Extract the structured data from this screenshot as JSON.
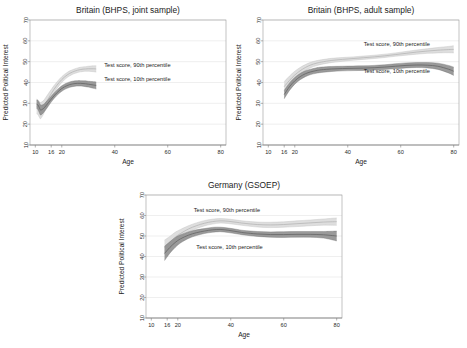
{
  "figure": {
    "name": "predicted-political-interest-by-age",
    "background": "#ffffff",
    "panel_count": 3
  },
  "style": {
    "band_90_fill": "#d9d9d9",
    "band_90_line": "#bcbcbc",
    "band_10_fill": "#8c8c8c",
    "band_10_line": "#6e6e6e",
    "gridline_color": "#dcdcdc",
    "frame_color": "#9a9a9a",
    "text_color": "#1c1c1c"
  },
  "chart_data": [
    {
      "type": "line",
      "panel_index": 0,
      "title": "Britain (BHPS, joint sample)",
      "xlabel": "Age",
      "ylabel": "Predicted Political Interest",
      "xlim": [
        8,
        82
      ],
      "ylim": [
        10,
        70
      ],
      "xticks": [
        10,
        16,
        20,
        40,
        60,
        80
      ],
      "xticklabels": [
        "10",
        "16",
        "20",
        "40",
        "60",
        "80"
      ],
      "yticks": [
        10,
        20,
        30,
        40,
        50,
        60,
        70
      ],
      "yticklabels": [
        "10",
        "20",
        "30",
        "40",
        "50",
        "60",
        "70"
      ],
      "grid": "horizontal",
      "legend": "inline-annotations",
      "annotations": [
        {
          "text": "Test score, 90th percentile",
          "x": 36,
          "y": 47.5
        },
        {
          "text": "Test score, 10th percentile",
          "x": 36,
          "y": 40.5
        }
      ],
      "series": [
        {
          "name": "Test score, 90th percentile",
          "color": "#d9d9d9",
          "x": [
            10.5,
            11,
            11.5,
            12,
            13,
            14,
            15,
            16,
            17,
            18,
            19,
            20,
            21,
            22,
            23,
            24,
            25,
            26,
            27,
            28,
            29,
            30,
            31,
            32,
            33
          ],
          "values": [
            28.6,
            28.2,
            27.2,
            26.6,
            28.0,
            30.2,
            32.4,
            34.6,
            36.6,
            38.4,
            40.0,
            41.4,
            42.6,
            43.6,
            44.4,
            45.0,
            45.5,
            45.9,
            46.2,
            46.4,
            46.5,
            46.6,
            46.6,
            46.6,
            46.5
          ],
          "ci_lower": [
            25.0,
            24.6,
            23.4,
            22.6,
            24.6,
            27.4,
            30.0,
            32.6,
            34.8,
            36.8,
            38.5,
            40.0,
            41.3,
            42.4,
            43.2,
            43.9,
            44.4,
            44.8,
            45.1,
            45.3,
            45.4,
            45.4,
            45.3,
            45.2,
            45.0
          ],
          "ci_upper": [
            32.0,
            31.6,
            30.8,
            30.4,
            31.2,
            32.9,
            34.8,
            36.6,
            38.4,
            40.0,
            41.5,
            42.8,
            43.9,
            44.8,
            45.6,
            46.1,
            46.6,
            47.0,
            47.3,
            47.5,
            47.6,
            47.8,
            47.9,
            48.0,
            48.0
          ]
        },
        {
          "name": "Test score, 10th percentile",
          "color": "#8c8c8c",
          "x": [
            10.5,
            11,
            11.5,
            12,
            13,
            14,
            15,
            16,
            17,
            18,
            19,
            20,
            21,
            22,
            23,
            24,
            25,
            26,
            27,
            28,
            29,
            30,
            31,
            32,
            33
          ],
          "values": [
            29.6,
            29.2,
            28.0,
            26.8,
            27.4,
            28.8,
            30.4,
            32.0,
            33.5,
            34.9,
            36.1,
            37.1,
            37.9,
            38.5,
            39.0,
            39.3,
            39.5,
            39.6,
            39.6,
            39.5,
            39.4,
            39.2,
            39.0,
            38.8,
            38.6
          ],
          "ci_lower": [
            27.6,
            27.0,
            25.6,
            24.4,
            25.4,
            27.0,
            28.8,
            30.6,
            32.2,
            33.6,
            34.8,
            35.8,
            36.6,
            37.2,
            37.7,
            38.0,
            38.2,
            38.3,
            38.3,
            38.2,
            38.0,
            37.8,
            37.5,
            37.2,
            36.9
          ],
          "ci_upper": [
            31.6,
            31.4,
            30.4,
            29.2,
            29.4,
            30.6,
            32.0,
            33.4,
            34.8,
            36.2,
            37.4,
            38.4,
            39.2,
            39.8,
            40.3,
            40.6,
            40.8,
            40.9,
            40.9,
            40.8,
            40.8,
            40.6,
            40.5,
            40.4,
            40.3
          ]
        }
      ]
    },
    {
      "type": "line",
      "panel_index": 1,
      "title": "Britain (BHPS, adult sample)",
      "xlabel": "Age",
      "ylabel": "Predicted Political Interest",
      "xlim": [
        8,
        82
      ],
      "ylim": [
        10,
        70
      ],
      "xticks": [
        10,
        16,
        20,
        40,
        60,
        80
      ],
      "xticklabels": [
        "10",
        "16",
        "20",
        "40",
        "60",
        "80"
      ],
      "yticks": [
        10,
        20,
        30,
        40,
        50,
        60,
        70
      ],
      "yticklabels": [
        "10",
        "20",
        "30",
        "40",
        "50",
        "60",
        "70"
      ],
      "grid": "horizontal",
      "legend": "inline-annotations",
      "annotations": [
        {
          "text": "Test score, 90th percentile",
          "x": 46,
          "y": 57.5
        },
        {
          "text": "Test score, 10th percentile",
          "x": 46,
          "y": 44.5
        }
      ],
      "series": [
        {
          "name": "Test score, 90th percentile",
          "color": "#d9d9d9",
          "x": [
            16,
            18,
            20,
            22,
            24,
            26,
            28,
            30,
            34,
            38,
            42,
            46,
            50,
            54,
            58,
            62,
            66,
            70,
            74,
            78,
            80
          ],
          "values": [
            38.0,
            41.0,
            43.6,
            45.6,
            47.2,
            48.4,
            49.2,
            49.8,
            50.6,
            51.1,
            51.5,
            51.9,
            52.3,
            52.8,
            53.4,
            54.0,
            54.6,
            55.1,
            55.5,
            55.8,
            55.9
          ],
          "ci_lower": [
            35.6,
            38.9,
            41.8,
            44.0,
            45.8,
            47.1,
            48.0,
            48.7,
            49.6,
            50.2,
            50.7,
            51.1,
            51.5,
            52.0,
            52.6,
            53.1,
            53.6,
            54.0,
            54.2,
            54.3,
            54.2
          ],
          "ci_upper": [
            40.4,
            43.1,
            45.4,
            47.2,
            48.6,
            49.7,
            50.4,
            50.9,
            51.6,
            52.0,
            52.3,
            52.7,
            53.1,
            53.6,
            54.2,
            54.9,
            55.6,
            56.2,
            56.8,
            57.3,
            57.6
          ]
        },
        {
          "name": "Test score, 10th percentile",
          "color": "#8c8c8c",
          "x": [
            16,
            18,
            20,
            22,
            24,
            26,
            28,
            30,
            34,
            38,
            42,
            46,
            50,
            54,
            58,
            62,
            66,
            70,
            74,
            78,
            80
          ],
          "values": [
            34.2,
            38.0,
            40.8,
            42.8,
            44.2,
            45.1,
            45.7,
            46.1,
            46.5,
            46.7,
            46.8,
            46.9,
            47.1,
            47.4,
            47.8,
            48.2,
            48.4,
            48.3,
            47.8,
            46.4,
            45.4
          ],
          "ci_lower": [
            32.2,
            36.2,
            39.2,
            41.3,
            42.8,
            43.8,
            44.4,
            44.8,
            45.3,
            45.6,
            45.7,
            45.8,
            46.0,
            46.3,
            46.6,
            47.0,
            47.2,
            47.0,
            46.3,
            44.6,
            43.4
          ],
          "ci_upper": [
            36.2,
            39.8,
            42.4,
            44.3,
            45.6,
            46.4,
            47.0,
            47.4,
            47.7,
            47.8,
            47.9,
            48.0,
            48.2,
            48.5,
            49.0,
            49.4,
            49.6,
            49.6,
            49.3,
            48.2,
            47.4
          ]
        }
      ]
    },
    {
      "type": "line",
      "panel_index": 2,
      "title": "Germany (GSOEP)",
      "xlabel": "Age",
      "ylabel": "Predicted Political Interest",
      "xlim": [
        8,
        82
      ],
      "ylim": [
        10,
        70
      ],
      "xticks": [
        10,
        16,
        20,
        40,
        60,
        80
      ],
      "xticklabels": [
        "10",
        "16",
        "20",
        "40",
        "60",
        "80"
      ],
      "yticks": [
        10,
        20,
        30,
        40,
        50,
        60,
        70
      ],
      "yticklabels": [
        "10",
        "20",
        "30",
        "40",
        "50",
        "60",
        "70"
      ],
      "grid": "horizontal",
      "legend": "inline-annotations",
      "annotations": [
        {
          "text": "Test score, 90th percentile",
          "x": 26,
          "y": 61.5
        },
        {
          "text": "Test score, 10th percentile",
          "x": 27,
          "y": 43.5
        }
      ],
      "series": [
        {
          "name": "Test score, 90th percentile",
          "color": "#d9d9d9",
          "x": [
            15,
            17,
            19,
            21,
            24,
            27,
            30,
            33,
            36,
            39,
            42,
            45,
            50,
            55,
            60,
            65,
            70,
            75,
            80
          ],
          "values": [
            44.5,
            47.0,
            49.4,
            51.2,
            53.4,
            55.0,
            56.2,
            57.0,
            57.4,
            57.2,
            56.7,
            56.2,
            55.6,
            55.4,
            55.6,
            56.0,
            56.4,
            56.8,
            57.0
          ],
          "ci_lower": [
            41.0,
            44.2,
            47.0,
            49.2,
            51.8,
            53.6,
            54.9,
            55.8,
            56.3,
            56.1,
            55.6,
            55.1,
            54.4,
            54.1,
            54.3,
            54.6,
            55.0,
            55.3,
            55.2
          ],
          "ci_upper": [
            48.0,
            49.8,
            51.8,
            53.2,
            55.0,
            56.4,
            57.5,
            58.2,
            58.5,
            58.3,
            57.8,
            57.3,
            56.8,
            56.7,
            56.9,
            57.4,
            57.8,
            58.3,
            58.8
          ]
        },
        {
          "name": "Test score, 10th percentile",
          "color": "#8c8c8c",
          "x": [
            15,
            17,
            19,
            21,
            24,
            27,
            30,
            33,
            36,
            39,
            42,
            45,
            50,
            55,
            60,
            65,
            70,
            75,
            80
          ],
          "values": [
            41.5,
            44.4,
            46.8,
            48.6,
            50.4,
            51.6,
            52.4,
            53.0,
            53.2,
            52.8,
            52.2,
            51.6,
            51.0,
            50.7,
            50.7,
            50.8,
            50.8,
            50.6,
            50.0
          ],
          "ci_lower": [
            38.0,
            41.6,
            44.4,
            46.6,
            48.8,
            50.2,
            51.2,
            51.8,
            52.1,
            51.7,
            51.1,
            50.5,
            49.8,
            49.4,
            49.3,
            49.4,
            49.4,
            49.0,
            47.6
          ],
          "ci_upper": [
            45.0,
            47.2,
            49.2,
            50.6,
            52.0,
            53.0,
            53.6,
            54.2,
            54.3,
            53.9,
            53.3,
            52.7,
            52.2,
            52.0,
            52.1,
            52.2,
            52.2,
            52.2,
            52.4
          ]
        }
      ]
    }
  ]
}
